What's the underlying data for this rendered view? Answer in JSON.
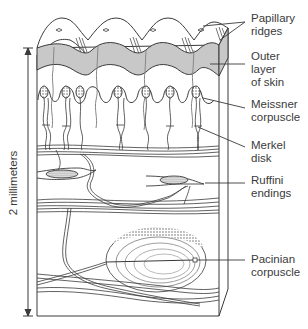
{
  "figure": {
    "scale_bar": {
      "label": "2 millimeters"
    },
    "labels": [
      {
        "id": "papillary-ridges",
        "lines": [
          "Papillary",
          "ridges"
        ]
      },
      {
        "id": "outer-layer",
        "lines": [
          "Outer",
          "layer",
          "of skin"
        ]
      },
      {
        "id": "meissner",
        "lines": [
          "Meissner",
          "corpuscle"
        ]
      },
      {
        "id": "merkel",
        "lines": [
          "Merkel",
          "disk"
        ]
      },
      {
        "id": "ruffini",
        "lines": [
          "Ruffini",
          "endings"
        ]
      },
      {
        "id": "pacinian",
        "lines": [
          "Pacinian",
          "corpuscle"
        ]
      }
    ],
    "colors": {
      "line": "#3a3a3a",
      "epidermis_fill": "#c8c8c8",
      "background": "#ffffff"
    }
  }
}
